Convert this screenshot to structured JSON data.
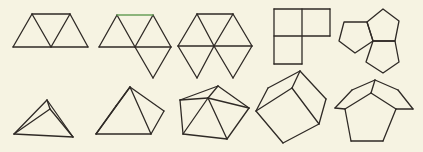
{
  "figure": {
    "background": "#f6f3e2",
    "stroke_color": "#2f2a26",
    "highlight_color": "#6aa05a",
    "top_row": [
      {
        "id": "net-3-triangles",
        "label": "three-triangle net",
        "segments": [
          [
            32,
            14,
            70,
            14
          ],
          [
            13,
            47,
            88,
            47
          ],
          [
            13,
            47,
            32,
            14
          ],
          [
            32,
            14,
            51,
            47
          ],
          [
            51,
            47,
            70,
            14
          ],
          [
            70,
            14,
            88,
            47
          ]
        ]
      },
      {
        "id": "net-4-triangles",
        "label": "four-triangle net (tetrahedron)",
        "highlight_segments": [
          [
            117,
            15,
            153,
            15
          ]
        ],
        "segments": [
          [
            99,
            47,
            171,
            47
          ],
          [
            99,
            47,
            117,
            15
          ],
          [
            117,
            15,
            135,
            47
          ],
          [
            135,
            47,
            153,
            15
          ],
          [
            153,
            15,
            171,
            47
          ],
          [
            135,
            47,
            153,
            78
          ],
          [
            153,
            78,
            171,
            47
          ]
        ]
      },
      {
        "id": "net-6-triangles",
        "label": "six-triangle hexagon net",
        "segments": [
          [
            197,
            14,
            233,
            14
          ],
          [
            178,
            46,
            252,
            46
          ],
          [
            178,
            46,
            197,
            14
          ],
          [
            197,
            14,
            214,
            46
          ],
          [
            214,
            46,
            233,
            14
          ],
          [
            233,
            14,
            252,
            46
          ],
          [
            178,
            46,
            197,
            78
          ],
          [
            197,
            78,
            214,
            46
          ],
          [
            214,
            46,
            233,
            78
          ],
          [
            233,
            78,
            252,
            46
          ]
        ]
      },
      {
        "id": "net-3-squares",
        "label": "three-square L net",
        "segments": [
          [
            274,
            9,
            330,
            9
          ],
          [
            274,
            36,
            330,
            36
          ],
          [
            274,
            64,
            302,
            64
          ],
          [
            274,
            9,
            274,
            64
          ],
          [
            302,
            9,
            302,
            64
          ],
          [
            330,
            9,
            330,
            36
          ]
        ]
      },
      {
        "id": "net-3-pentagons",
        "label": "three-pentagon net",
        "polygons": [
          [
            [
              383,
              9
            ],
            [
              399,
              21
            ],
            [
              395,
              41
            ],
            [
              373,
              41
            ],
            [
              367,
              22
            ]
          ],
          [
            [
              344,
              22
            ],
            [
              367,
              22
            ],
            [
              373,
              41
            ],
            [
              355,
              53
            ],
            [
              339,
              41
            ]
          ],
          [
            [
              373,
              41
            ],
            [
              395,
              41
            ],
            [
              399,
              62
            ],
            [
              383,
              73
            ],
            [
              366,
              62
            ]
          ]
        ]
      }
    ],
    "bottom_row": [
      {
        "id": "solid-3-triangles",
        "label": "triangular corner solid",
        "segments": [
          [
            14,
            134,
            47,
            100
          ],
          [
            47,
            100,
            73,
            137
          ],
          [
            14,
            134,
            73,
            137
          ],
          [
            47,
            100,
            50,
            109
          ],
          [
            50,
            109,
            14,
            134
          ],
          [
            50,
            109,
            73,
            137
          ]
        ]
      },
      {
        "id": "solid-tetrahedron",
        "label": "tetrahedron",
        "segments": [
          [
            96,
            134,
            130,
            87
          ],
          [
            130,
            87,
            151,
            134
          ],
          [
            96,
            134,
            151,
            134
          ],
          [
            130,
            87,
            164,
            111
          ],
          [
            164,
            111,
            151,
            134
          ],
          [
            96,
            134,
            116,
            106
          ],
          [
            116,
            106,
            130,
            87
          ]
        ]
      },
      {
        "id": "solid-6-triangles",
        "label": "six-triangle cap",
        "segments": [
          [
            180,
            100,
            218,
            86
          ],
          [
            218,
            86,
            249,
            108
          ],
          [
            180,
            100,
            183,
            134
          ],
          [
            183,
            134,
            227,
            139
          ],
          [
            227,
            139,
            249,
            108
          ],
          [
            180,
            100,
            208,
            98
          ],
          [
            218,
            86,
            208,
            98
          ],
          [
            208,
            98,
            249,
            108
          ],
          [
            208,
            98,
            183,
            134
          ],
          [
            208,
            98,
            227,
            139
          ]
        ]
      },
      {
        "id": "solid-cube-corner",
        "label": "cube corner",
        "segments": [
          [
            256,
            111,
            268,
            88
          ],
          [
            268,
            88,
            300,
            71
          ],
          [
            300,
            71,
            292,
            88
          ],
          [
            292,
            88,
            256,
            111
          ],
          [
            300,
            71,
            326,
            99
          ],
          [
            326,
            99,
            319,
            124
          ],
          [
            292,
            88,
            319,
            124
          ],
          [
            256,
            111,
            283,
            143
          ],
          [
            283,
            143,
            319,
            124
          ]
        ]
      },
      {
        "id": "solid-pentagon-corner",
        "label": "dodecahedron corner",
        "segments": [
          [
            335,
            108,
            352,
            90
          ],
          [
            352,
            90,
            375,
            80
          ],
          [
            375,
            80,
            398,
            90
          ],
          [
            398,
            90,
            413,
            109
          ],
          [
            375,
            80,
            371,
            93
          ],
          [
            371,
            93,
            345,
            109
          ],
          [
            345,
            109,
            335,
            108
          ],
          [
            371,
            93,
            396,
            109
          ],
          [
            396,
            109,
            413,
            109
          ],
          [
            345,
            109,
            351,
            141
          ],
          [
            351,
            141,
            383,
            141
          ],
          [
            383,
            141,
            396,
            109
          ]
        ]
      }
    ]
  }
}
